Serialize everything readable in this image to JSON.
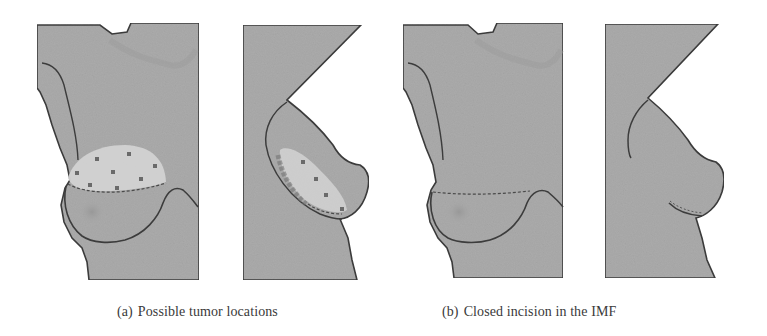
{
  "figure": {
    "subfigures": [
      {
        "id": "a",
        "tag": "(a)",
        "caption": "Possible tumor locations",
        "views": [
          "frontal",
          "lateral"
        ],
        "tumor_marker_count_frontal": 9,
        "tumor_marker_count_lateral": 4
      },
      {
        "id": "b",
        "tag": "(b)",
        "caption": "Closed incision in the IMF",
        "views": [
          "frontal",
          "lateral"
        ]
      }
    ],
    "colors": {
      "skin": "#a9a9a9",
      "skin_light": "#b8b8b8",
      "tumor_region": "#cfcfcf",
      "outline": "#3c3c3c",
      "marker": "#6a6a6a",
      "caption_text": "#3a3a3a"
    }
  }
}
